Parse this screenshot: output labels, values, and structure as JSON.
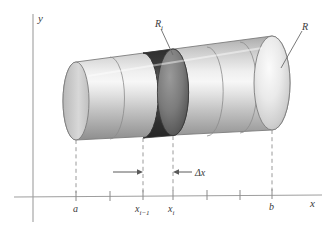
{
  "figure": {
    "kind": "solid-of-revolution-slicing-diagram",
    "background_color": "#ffffff"
  },
  "axes": {
    "y_axis_label": "y",
    "x_axis_label": "x",
    "axis_color": "#9a9a9a",
    "x_axis_y": 197,
    "y_axis_x": 33,
    "x_axis_start_x": 14,
    "x_axis_end_x": 322,
    "y_axis_top_y": 14,
    "y_axis_bottom_y": 222,
    "ticks": [
      {
        "x": 76,
        "label": "a"
      },
      {
        "x": 110,
        "label": ""
      },
      {
        "x": 143,
        "label": "x",
        "sublabel": "i−1"
      },
      {
        "x": 173,
        "label": "x",
        "sublabel": "i"
      },
      {
        "x": 207,
        "label": ""
      },
      {
        "x": 240,
        "label": ""
      },
      {
        "x": 272,
        "label": "b"
      }
    ]
  },
  "labels": {
    "a": "a",
    "b": "b",
    "x_prev_base": "x",
    "x_prev_sub": "i−1",
    "x_i_base": "x",
    "x_i_sub": "i",
    "delta_x": "Δx",
    "radius_i_base": "R",
    "radius_i_sub": "i",
    "radius_base": "R",
    "y": "y",
    "x": "x"
  },
  "solid": {
    "description": "horizontal solid of revolution drawn as a cylinder in perspective, sliced into disks",
    "left_end_x": 76,
    "right_end_x": 272,
    "slice_boundaries_x": [
      76,
      110,
      143,
      173,
      207,
      240,
      272
    ],
    "highlighted_slice": {
      "from_x": 143,
      "to_x": 173,
      "fill_color": "#4a4a4a",
      "label": "R",
      "sublabel": "i"
    },
    "body_fill_light": "#f2f2f2",
    "body_fill_mid": "#c9c9c9",
    "body_fill_dark": "#8f8f8f",
    "outline_color": "#6b6b6b",
    "right_cap_label": "R"
  },
  "annotations": {
    "delta_x_arrow": {
      "text": "Δx",
      "left_arrow_tip_x": 143,
      "right_arrow_tip_x": 173,
      "y": 173
    },
    "leader_lines": [
      {
        "name": "R_i-leader",
        "from": [
          162,
          27
        ],
        "to": [
          175,
          55
        ]
      },
      {
        "name": "R-leader",
        "from": [
          303,
          30
        ],
        "to": [
          283,
          67
        ]
      }
    ],
    "dashed_drop_lines_x": [
      76,
      143,
      173,
      272
    ]
  }
}
